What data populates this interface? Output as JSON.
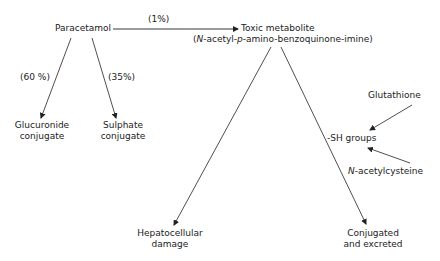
{
  "diagram": {
    "type": "metabolic-pathway",
    "nodes": {
      "paracetamol": "Paracetamol",
      "toxic_metabolite": "Toxic metabolite",
      "toxic_metabolite_name_prefix": "N",
      "toxic_metabolite_name_mid1": "-acetyl-",
      "toxic_metabolite_name_p": "p",
      "toxic_metabolite_name_rest": "-amino-benzoquinone-imine)",
      "glucuronide_line1": "Glucuronide",
      "glucuronide_line2": "conjugate",
      "sulphate_line1": "Sulphate",
      "sulphate_line2": "conjugate",
      "glutathione": "Glutathione",
      "sh_groups": "-SH groups",
      "nac_prefix": "N",
      "nac_rest": "-acetylcysteine",
      "hepatocellular_line1": "Hepatocellular",
      "hepatocellular_line2": "damage",
      "conjugated_line1": "Conjugated",
      "conjugated_line2": "and excreted"
    },
    "edge_labels": {
      "to_toxic": "(1%)",
      "to_glucuronide": "(60 %)",
      "to_sulphate": "(35%)"
    },
    "edges": [
      {
        "from": "Paracetamol",
        "to": "Toxic metabolite",
        "label": "(1%)"
      },
      {
        "from": "Paracetamol",
        "to": "Glucuronide conjugate",
        "label": "(60 %)"
      },
      {
        "from": "Paracetamol",
        "to": "Sulphate conjugate",
        "label": "(35%)"
      },
      {
        "from": "Toxic metabolite",
        "to": "Hepatocellular damage"
      },
      {
        "from": "Toxic metabolite",
        "to": "Conjugated and excreted"
      },
      {
        "from": "Glutathione",
        "to": "-SH groups"
      },
      {
        "from": "N-acetylcysteine",
        "to": "-SH groups"
      }
    ]
  }
}
